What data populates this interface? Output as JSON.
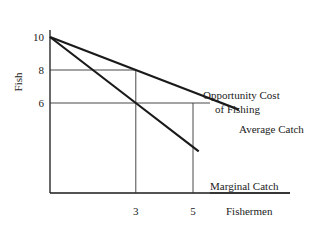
{
  "chart_data": {
    "type": "line",
    "title": "",
    "xlabel": "Fishermen",
    "ylabel": "Fish",
    "xlim": [
      0,
      7.5
    ],
    "ylim": [
      0,
      10.5
    ],
    "x_ticks": [
      3,
      5
    ],
    "y_ticks": [
      6,
      8,
      10
    ],
    "x_tick_labels": [
      "3",
      "5"
    ],
    "y_tick_labels": [
      "6",
      "8",
      "10"
    ],
    "grid": false,
    "series": [
      {
        "name": "Average Catch",
        "points": [
          [
            0,
            10
          ],
          [
            3,
            8
          ],
          [
            5,
            6.67
          ],
          [
            6.6,
            5.6
          ]
        ],
        "color": "#1a1a1a"
      },
      {
        "name": "Marginal Catch",
        "points": [
          [
            0,
            10
          ],
          [
            3,
            6
          ],
          [
            5.2,
            3.07
          ]
        ],
        "color": "#1a1a1a"
      }
    ],
    "reference_lines": [
      {
        "name": "opportunity-cost-line",
        "type": "horizontal",
        "y": 6,
        "x_from": 0,
        "x_to": 5,
        "label": "Opportunity Cost of Fishing"
      },
      {
        "name": "avg-catch-guide",
        "type": "horizontal",
        "y": 8,
        "x_from": 0,
        "x_to": 3
      },
      {
        "name": "x3-guide",
        "type": "vertical",
        "x": 3,
        "y_from": 0,
        "y_to": 8
      },
      {
        "name": "x5-guide",
        "type": "vertical",
        "x": 5,
        "y_from": 0,
        "y_to": 6
      }
    ],
    "annotations": [
      {
        "text_line1": "Opportunity Cost",
        "text_line2": "of Fishing"
      },
      {
        "text": "Average Catch"
      },
      {
        "text": "Marginal Catch"
      }
    ]
  }
}
